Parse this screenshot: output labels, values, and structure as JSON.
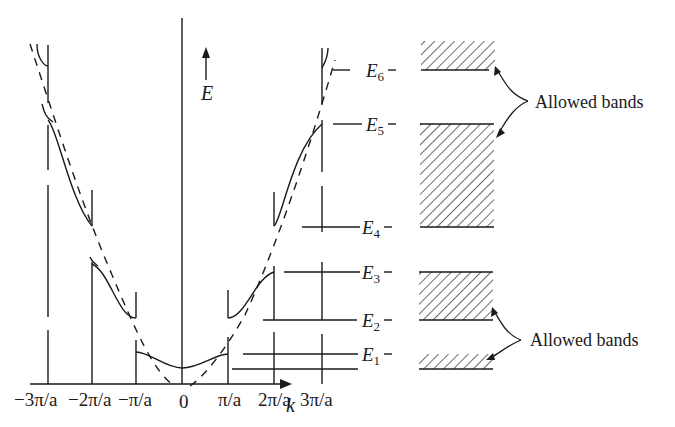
{
  "figure": {
    "type": "energy-band diagram (E vs k) with extended-zone dispersion and allowed bands",
    "axis": {
      "y_label": "E",
      "x_label": "k",
      "ticks": [
        {
          "label": "−3π/a",
          "x": 48
        },
        {
          "label": "−2π/a",
          "x": 92
        },
        {
          "label": "−π/a",
          "x": 136
        },
        {
          "label": "0",
          "x": 182
        },
        {
          "label": "π/a",
          "x": 228
        },
        {
          "label": "2π/a",
          "x": 274
        },
        {
          "label": "3π/a",
          "x": 320
        }
      ]
    },
    "energy_levels": [
      {
        "name": "E",
        "sub": "6",
        "y": 70
      },
      {
        "name": "E",
        "sub": "5",
        "y": 124
      },
      {
        "name": "E",
        "sub": "4",
        "y": 227
      },
      {
        "name": "E",
        "sub": "3",
        "y": 272
      },
      {
        "name": "E",
        "sub": "2",
        "y": 320
      },
      {
        "name": "E",
        "sub": "1",
        "y": 354
      }
    ],
    "bands": [
      {
        "from": "E1",
        "top": 354,
        "bottom": 369
      },
      {
        "from": "E2-E3",
        "top": 272,
        "bottom": 320
      },
      {
        "from": "E4-E5",
        "top": 124,
        "bottom": 227
      },
      {
        "from": "E6",
        "top": 40,
        "bottom": 70
      }
    ],
    "annotations": [
      {
        "text": "Allowed bands",
        "position": "upper"
      },
      {
        "text": "Allowed bands",
        "position": "lower"
      }
    ],
    "colors": {
      "ink": "#1a1a1a",
      "background": "#ffffff"
    }
  }
}
